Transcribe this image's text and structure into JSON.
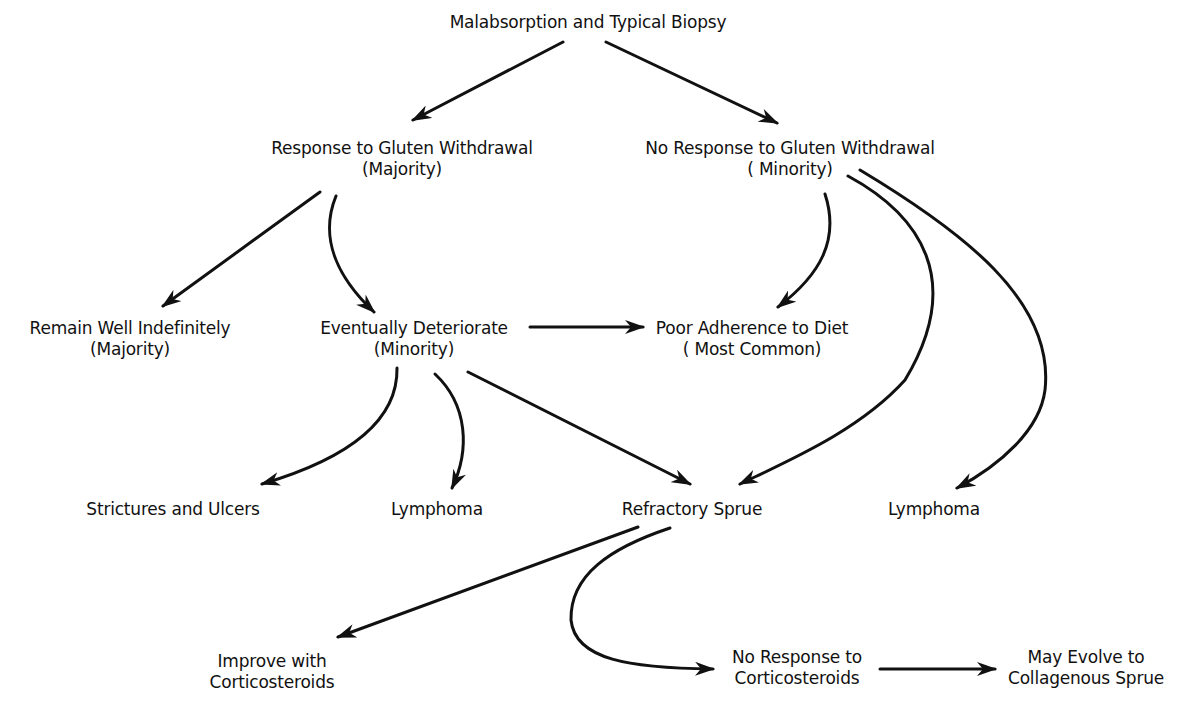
{
  "diagram": {
    "title": "Malabsorption and Typical Biopsy",
    "colors": {
      "background": "#ffffff",
      "ink": "#111111"
    },
    "nodes": {
      "root": {
        "line1": "Malabsorption and Typical Biopsy"
      },
      "response": {
        "line1": "Response to Gluten Withdrawal",
        "line2": "(Majority)"
      },
      "no_response": {
        "line1": "No Response to Gluten Withdrawal",
        "line2": "( Minority)"
      },
      "remain_well": {
        "line1": "Remain Well Indefinitely",
        "line2": "(Majority)"
      },
      "deteriorate": {
        "line1": "Eventually Deteriorate",
        "line2": "(Minority)"
      },
      "poor_adherence": {
        "line1": "Poor Adherence to Diet",
        "line2": "( Most Common)"
      },
      "strictures": {
        "line1": "Strictures and Ulcers"
      },
      "lymphoma_left": {
        "line1": "Lymphoma"
      },
      "refractory": {
        "line1": "Refractory Sprue"
      },
      "lymphoma_right": {
        "line1": "Lymphoma"
      },
      "improve": {
        "line1": "Improve with",
        "line2": "Corticosteroids"
      },
      "no_response_cs": {
        "line1": "No Response to",
        "line2": "Corticosteroids"
      },
      "collagenous": {
        "line1": "May Evolve to",
        "line2": "Collagenous Sprue"
      }
    },
    "edges": [
      {
        "from": "root",
        "to": "response",
        "shape": "straight"
      },
      {
        "from": "root",
        "to": "no_response",
        "shape": "straight"
      },
      {
        "from": "response",
        "to": "remain_well",
        "shape": "straight"
      },
      {
        "from": "response",
        "to": "deteriorate",
        "shape": "curved"
      },
      {
        "from": "no_response",
        "to": "poor_adherence",
        "shape": "curved"
      },
      {
        "from": "no_response",
        "to": "refractory",
        "shape": "curved"
      },
      {
        "from": "no_response",
        "to": "lymphoma_right",
        "shape": "curved"
      },
      {
        "from": "deteriorate",
        "to": "poor_adherence",
        "shape": "straight"
      },
      {
        "from": "deteriorate",
        "to": "strictures",
        "shape": "curved"
      },
      {
        "from": "deteriorate",
        "to": "lymphoma_left",
        "shape": "curved"
      },
      {
        "from": "deteriorate",
        "to": "refractory",
        "shape": "straight"
      },
      {
        "from": "refractory",
        "to": "improve",
        "shape": "straight"
      },
      {
        "from": "refractory",
        "to": "no_response_cs",
        "shape": "curved"
      },
      {
        "from": "no_response_cs",
        "to": "collagenous",
        "shape": "straight"
      }
    ]
  }
}
